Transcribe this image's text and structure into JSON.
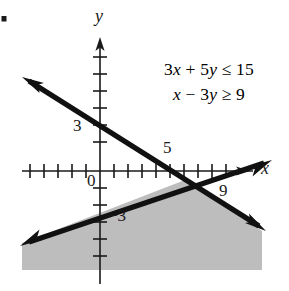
{
  "figure": {
    "kind": "cartesian-graph",
    "bullet_marker": "filled-square-bullet",
    "axes": {
      "x_axis_label": "x",
      "y_axis_label": "y",
      "origin_label": "0"
    },
    "tick_labels": {
      "y_positive": "3",
      "y_negative": "−3",
      "x_five": "5",
      "x_nine": "9"
    },
    "inequalities": {
      "first": "3x + 5y ≤ 15",
      "second": "x − 3y ≥ 9",
      "first_parts": {
        "c1": "3",
        "v1": "x",
        "op1": "+",
        "c2": "5",
        "v2": "y",
        "rel": "≤",
        "rhs": "15"
      },
      "second_parts": {
        "v1": "x",
        "op1": "−",
        "c2": "3",
        "v2": "y",
        "rel": "≥",
        "rhs": "9"
      }
    },
    "colors": {
      "ink": "#1a1a1a",
      "line": "#111111",
      "shade": "#bdbdbd",
      "background": "#ffffff"
    }
  },
  "chart_data": {
    "type": "line",
    "title": "",
    "xlabel": "x",
    "ylabel": "y",
    "grid": false,
    "legend": "none",
    "xlim": [
      -5,
      11
    ],
    "ylim": [
      -8,
      7
    ],
    "x_ticks": [
      -5,
      -4,
      -3,
      -2,
      -1,
      0,
      1,
      2,
      3,
      4,
      5,
      6,
      7,
      8,
      9
    ],
    "y_ticks": [
      -7,
      -6,
      -5,
      -4,
      -3,
      -2,
      -1,
      0,
      1,
      2,
      3,
      4,
      5,
      6
    ],
    "labeled_ticks": [
      {
        "axis": "y",
        "value": 3,
        "text": "3"
      },
      {
        "axis": "y",
        "value": -3,
        "text": "−3"
      },
      {
        "axis": "x",
        "value": 5,
        "text": "5"
      },
      {
        "axis": "x",
        "value": 9,
        "text": "9"
      },
      {
        "axis": "origin",
        "value": 0,
        "text": "0"
      }
    ],
    "series": [
      {
        "name": "3x + 5y = 15",
        "slope": -0.6,
        "y_intercept": 3,
        "x_intercept": 5,
        "style": "solid-bold-double-arrow",
        "points": [
          [
            -5,
            6
          ],
          [
            0,
            3
          ],
          [
            5,
            0
          ],
          [
            10,
            -3
          ]
        ]
      },
      {
        "name": "x - 3y = 9",
        "slope": 0.3333,
        "y_intercept": -3,
        "x_intercept": 9,
        "style": "solid-bold-double-arrow",
        "points": [
          [
            -5,
            -4.667
          ],
          [
            0,
            -3
          ],
          [
            9,
            0
          ],
          [
            11,
            0.667
          ]
        ]
      }
    ],
    "shaded_region": {
      "description": "solution set of 3x + 5y ≤ 15 and x − 3y ≥ 9",
      "fill": "#bdbdbd",
      "vertex": [
        5.625,
        -1.125
      ],
      "bounded_above_left_by": "x - 3y = 9",
      "bounded_above_right_by": "3x + 5y = 15"
    },
    "annotations": [
      {
        "text": "3x + 5y ≤ 15",
        "x": 4.2,
        "y": 4.3
      },
      {
        "text": "x − 3y ≥ 9",
        "x": 4.2,
        "y": 3.1
      }
    ]
  }
}
